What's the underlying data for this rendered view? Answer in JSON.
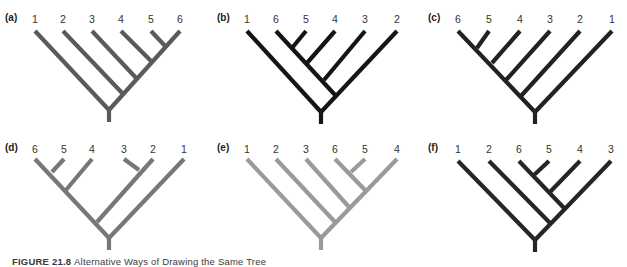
{
  "figure": {
    "caption_label": "FIGURE 21.8",
    "caption_text": "Alternative Ways of Drawing the Same Tree",
    "panels": [
      {
        "id": "a",
        "label": "(a)",
        "color": "#5a5a5a",
        "tips": [
          "1",
          "2",
          "3",
          "4",
          "5",
          "6"
        ],
        "origin": [
          0,
          0
        ],
        "tip_x": [
          35,
          63,
          92,
          121,
          151,
          180
        ],
        "internal_nodes": [
          [
            109,
            110
          ],
          [
            124,
            95
          ],
          [
            138,
            80
          ],
          [
            153,
            63
          ],
          [
            167,
            48
          ]
        ],
        "edges": [
          [
            35,
            31,
            109,
            110
          ],
          [
            63,
            31,
            124,
            95
          ],
          [
            92,
            31,
            138,
            80
          ],
          [
            121,
            31,
            153,
            63
          ],
          [
            151,
            31,
            167,
            48
          ],
          [
            180,
            31,
            109,
            110
          ],
          [
            109,
            110,
            109,
            122
          ]
        ]
      },
      {
        "id": "b",
        "label": "(b)",
        "color": "#151515",
        "tips": [
          "1",
          "6",
          "5",
          "4",
          "3",
          "2"
        ],
        "origin": [
          210,
          0
        ],
        "tip_x": [
          37,
          66,
          96,
          125,
          155,
          187
        ],
        "internal_nodes": [
          [
            111,
            112
          ],
          [
            126,
            96
          ],
          [
            114,
            80
          ],
          [
            97,
            63
          ],
          [
            82,
            48
          ]
        ],
        "edges": [
          [
            37,
            31,
            111,
            112
          ],
          [
            187,
            31,
            111,
            112
          ],
          [
            66,
            31,
            126,
            96
          ],
          [
            155,
            31,
            114,
            80
          ],
          [
            125,
            31,
            97,
            63
          ],
          [
            96,
            31,
            82,
            48
          ],
          [
            111,
            112,
            111,
            124
          ]
        ]
      },
      {
        "id": "c",
        "label": "(c)",
        "color": "#222222",
        "tips": [
          "6",
          "5",
          "4",
          "3",
          "2",
          "1"
        ],
        "origin": [
          417,
          0
        ],
        "tip_x": [
          41,
          72,
          103,
          133,
          163,
          195
        ],
        "internal_nodes": [
          [
            118,
            112
          ],
          [
            104,
            96
          ],
          [
            89,
            80
          ],
          [
            75,
            63
          ],
          [
            60,
            48
          ]
        ],
        "edges": [
          [
            41,
            31,
            118,
            112
          ],
          [
            195,
            31,
            118,
            112
          ],
          [
            72,
            31,
            60,
            48
          ],
          [
            103,
            31,
            75,
            63
          ],
          [
            133,
            31,
            89,
            80
          ],
          [
            163,
            31,
            104,
            96
          ],
          [
            118,
            112,
            118,
            124
          ]
        ]
      },
      {
        "id": "d",
        "label": "(d)",
        "color": "#777777",
        "tips": [
          "6",
          "5",
          "4",
          "3",
          "2",
          "1"
        ],
        "origin": [
          0,
          130
        ],
        "tip_x": [
          35,
          64,
          92,
          124,
          153,
          184
        ],
        "internal_nodes": [
          [
            109,
            108
          ],
          [
            97,
            92
          ],
          [
            66,
            60
          ],
          [
            52,
            42
          ],
          [
            139,
            40
          ]
        ],
        "edges": [
          [
            35,
            29,
            109,
            108
          ],
          [
            184,
            29,
            109,
            108
          ],
          [
            64,
            29,
            52,
            42
          ],
          [
            92,
            29,
            66,
            60
          ],
          [
            153,
            29,
            97,
            92
          ],
          [
            124,
            29,
            139,
            40
          ],
          [
            109,
            108,
            109,
            120
          ]
        ]
      },
      {
        "id": "e",
        "label": "(e)",
        "color": "#9a9a9a",
        "tips": [
          "1",
          "2",
          "3",
          "6",
          "5",
          "4"
        ],
        "origin": [
          210,
          130
        ],
        "tip_x": [
          37,
          66,
          96,
          125,
          155,
          187
        ],
        "internal_nodes": [
          [
            111,
            108
          ],
          [
            125,
            92
          ],
          [
            139,
            77
          ],
          [
            155,
            60
          ],
          [
            141,
            42
          ]
        ],
        "edges": [
          [
            37,
            29,
            111,
            108
          ],
          [
            187,
            29,
            111,
            108
          ],
          [
            66,
            29,
            125,
            92
          ],
          [
            96,
            29,
            139,
            77
          ],
          [
            125,
            29,
            155,
            60
          ],
          [
            155,
            29,
            141,
            42
          ],
          [
            111,
            108,
            111,
            120
          ]
        ]
      },
      {
        "id": "f",
        "label": "(f)",
        "color": "#262626",
        "tips": [
          "1",
          "2",
          "6",
          "5",
          "4",
          "3"
        ],
        "origin": [
          417,
          130
        ],
        "tip_x": [
          41,
          72,
          102,
          132,
          163,
          194
        ],
        "internal_nodes": [
          [
            118,
            110
          ],
          [
            133,
            93
          ],
          [
            147,
            78
          ],
          [
            133,
            62
          ],
          [
            117,
            45
          ]
        ],
        "edges": [
          [
            41,
            31,
            118,
            110
          ],
          [
            194,
            31,
            118,
            110
          ],
          [
            72,
            31,
            133,
            93
          ],
          [
            102,
            31,
            147,
            78
          ],
          [
            163,
            31,
            133,
            62
          ],
          [
            132,
            31,
            117,
            45
          ],
          [
            118,
            110,
            118,
            122
          ]
        ]
      }
    ]
  }
}
